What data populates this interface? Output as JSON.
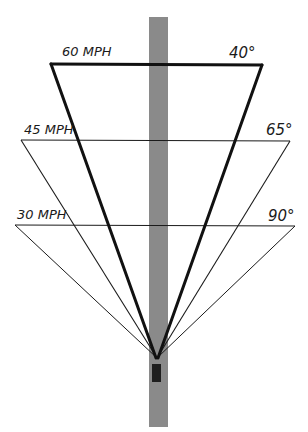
{
  "diagram": {
    "road": {
      "color": "#8a8a8a"
    },
    "car": {
      "color": "#1e1e1e"
    },
    "line_color": "#151515",
    "levels": [
      {
        "speed_label": "60 MPH",
        "angle_label": "40°"
      },
      {
        "speed_label": "45 MPH",
        "angle_label": "65°"
      },
      {
        "speed_label": "30 MPH",
        "angle_label": "90°"
      }
    ]
  }
}
